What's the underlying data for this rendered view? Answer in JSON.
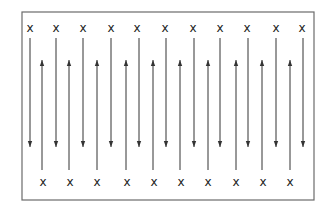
{
  "diagram": {
    "title": "",
    "frame": {
      "left": 22,
      "top": 12,
      "right": 314,
      "bottom": 200,
      "stroke": "#6b6b6b"
    },
    "marker_glyph": "x",
    "line_color": "#333333",
    "top_markers": {
      "y": 28,
      "x": [
        30,
        56,
        83,
        111,
        137,
        165,
        193,
        220,
        247,
        276,
        302
      ]
    },
    "bottom_markers": {
      "y": 182,
      "x": [
        43,
        70,
        97,
        127,
        154,
        181,
        208,
        236,
        263,
        290
      ]
    },
    "down_arrows": {
      "y_start": 38,
      "y_end": 147,
      "x": [
        30,
        56,
        83,
        111,
        139,
        166,
        194,
        220,
        248,
        276,
        303
      ]
    },
    "up_arrows": {
      "y_start": 170,
      "y_end": 60,
      "x": [
        42,
        69,
        97,
        126,
        153,
        180,
        208,
        236,
        262,
        290
      ]
    }
  }
}
